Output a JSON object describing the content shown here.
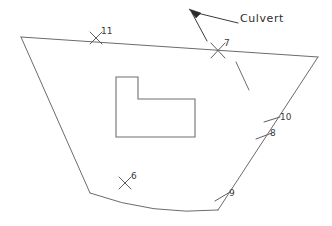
{
  "drawing": {
    "title": "Parcel boundary survey sketch",
    "background_color": "#ffffff",
    "line_color": "#6b6b6b",
    "text_color": "#2e2e2e",
    "width": 332,
    "height": 226
  },
  "annotations": [
    {
      "id": "culvert",
      "label": "Culvert",
      "x": 240,
      "y": 18,
      "leader_dash_x": 232,
      "leader_dash_y": 24
    }
  ],
  "points": [
    {
      "id": "pt-11",
      "label": "11",
      "marker": "x-mark",
      "x": 96,
      "y": 38,
      "label_x": 101,
      "label_y": 31
    },
    {
      "id": "pt-7",
      "label": "7",
      "marker": "x-mark",
      "x": 218,
      "y": 50,
      "label_x": 223,
      "label_y": 43
    },
    {
      "id": "pt-10",
      "label": "10",
      "marker": "tick",
      "x": 272,
      "y": 120,
      "label_x": 279,
      "label_y": 116
    },
    {
      "id": "pt-8",
      "label": "8",
      "marker": "tick",
      "x": 264,
      "y": 136,
      "label_x": 269,
      "label_y": 133
    },
    {
      "id": "pt-9",
      "label": "9",
      "marker": "tick",
      "x": 222,
      "y": 197,
      "label_x": 228,
      "label_y": 193
    },
    {
      "id": "pt-6",
      "label": "6",
      "marker": "x-mark",
      "x": 125,
      "y": 183,
      "label_x": 130,
      "label_y": 176
    }
  ],
  "geometry": {
    "boundary": {
      "name": "parcel-boundary",
      "vertices": [
        {
          "name": "top-left",
          "x": 21,
          "y": 37
        },
        {
          "name": "top-right",
          "x": 318,
          "y": 57
        },
        {
          "name": "bottom-right",
          "x": 218,
          "y": 210
        },
        {
          "name": "bottom-left",
          "x": 90,
          "y": 193
        }
      ],
      "bottom_edge_type": "curve",
      "bottom_edge_control": {
        "x": 154,
        "y": 216
      }
    },
    "building": {
      "name": "building-footprint",
      "shape": "L-shaped",
      "vertices": [
        {
          "x": 116,
          "y": 77
        },
        {
          "x": 138,
          "y": 77
        },
        {
          "x": 138,
          "y": 99
        },
        {
          "x": 195,
          "y": 99
        },
        {
          "x": 195,
          "y": 137
        },
        {
          "x": 116,
          "y": 137
        }
      ]
    },
    "culvert_marker": {
      "name": "culvert-indicator",
      "segment": {
        "x1": 236,
        "y1": 62,
        "x2": 249,
        "y2": 90
      }
    },
    "leader": {
      "name": "culvert-leader",
      "arrow_tip": {
        "x": 190,
        "y": 10
      },
      "path_a": {
        "x1": 192,
        "y1": 12,
        "x2": 238,
        "y2": 23
      },
      "path_b": {
        "x1": 192,
        "y1": 13,
        "x2": 207,
        "y2": 40
      }
    }
  }
}
